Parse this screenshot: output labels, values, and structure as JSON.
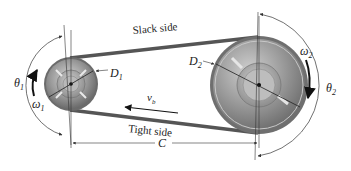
{
  "diagram": {
    "labels": {
      "slack_side": "Slack side",
      "tight_side": "Tight side",
      "D1": "D",
      "D1_sub": "1",
      "D2": "D",
      "D2_sub": "2",
      "theta1": "θ",
      "theta1_sub": "1",
      "theta2": "θ",
      "theta2_sub": "2",
      "omega1": "ω",
      "omega1_sub": "1",
      "omega2": "ω",
      "omega2_sub": "2",
      "vb": "v",
      "vb_sub": "b",
      "C": "C"
    },
    "colors": {
      "belt": "#555555",
      "pulley_outer": "#8a8a8a",
      "pulley_inner": "#b0b0b0",
      "line": "#333333"
    },
    "small_pulley": {
      "cx": 71,
      "cy": 84,
      "r": 26
    },
    "large_pulley": {
      "cx": 259,
      "cy": 85,
      "r": 48
    }
  }
}
